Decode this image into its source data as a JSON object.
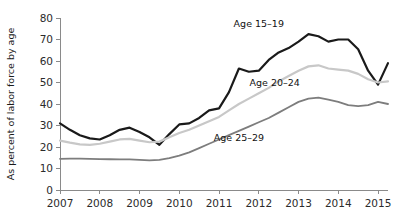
{
  "chart_data": {
    "type": "line",
    "title": "",
    "xlabel": "",
    "ylabel": "As percent of labor force by age",
    "xlim": [
      2007,
      2015.25
    ],
    "ylim": [
      0,
      80
    ],
    "grid": false,
    "legend_position": "inline-annotations",
    "x_ticks": [
      "2007",
      "2008",
      "2009",
      "2010",
      "2011",
      "2012",
      "2013",
      "2014",
      "2015"
    ],
    "x_tick_values": [
      2007,
      2008,
      2009,
      2010,
      2011,
      2012,
      2013,
      2014,
      2015
    ],
    "y_ticks": [
      "0",
      "10",
      "20",
      "30",
      "40",
      "50",
      "60",
      "70",
      "80"
    ],
    "y_tick_values": [
      0,
      10,
      20,
      30,
      40,
      50,
      60,
      70,
      80
    ],
    "x": [
      2007.0,
      2007.25,
      2007.5,
      2007.75,
      2008.0,
      2008.25,
      2008.5,
      2008.75,
      2009.0,
      2009.25,
      2009.5,
      2009.75,
      2010.0,
      2010.25,
      2010.5,
      2010.75,
      2011.0,
      2011.25,
      2011.5,
      2011.75,
      2012.0,
      2012.25,
      2012.5,
      2012.75,
      2013.0,
      2013.25,
      2013.5,
      2013.75,
      2014.0,
      2014.25,
      2014.5,
      2014.75,
      2015.0,
      2015.25
    ],
    "series": [
      {
        "name": "Age 15-19",
        "label": "Age 15–19",
        "color": "#1a1a1a",
        "width": 2.2,
        "values": [
          31.0,
          28.0,
          25.5,
          24.0,
          23.5,
          25.5,
          28.0,
          29.0,
          27.0,
          24.5,
          21.0,
          26.0,
          30.5,
          31.0,
          33.5,
          37.0,
          38.0,
          45.5,
          56.5,
          55.0,
          55.5,
          60.5,
          64.0,
          66.0,
          69.0,
          72.5,
          71.5,
          69.0,
          70.0,
          70.0,
          65.5,
          55.5,
          49.0,
          59.0
        ]
      },
      {
        "name": "Age 20-24",
        "label": "Age 20–24",
        "color": "#c8c8c8",
        "width": 2.2,
        "values": [
          23.0,
          22.0,
          21.2,
          21.0,
          21.5,
          22.5,
          23.5,
          23.8,
          23.0,
          22.2,
          22.5,
          24.5,
          26.5,
          28.0,
          30.0,
          32.0,
          34.0,
          37.0,
          40.0,
          42.5,
          45.0,
          47.5,
          50.5,
          53.0,
          55.5,
          57.5,
          58.0,
          56.5,
          56.0,
          55.5,
          54.0,
          51.5,
          50.0,
          50.5
        ]
      },
      {
        "name": "Age 25-29",
        "label": "Age 25–29",
        "color": "#7d7d7d",
        "width": 1.8,
        "values": [
          14.5,
          14.6,
          14.6,
          14.5,
          14.4,
          14.3,
          14.2,
          14.2,
          14.0,
          13.8,
          14.0,
          14.8,
          16.0,
          17.5,
          19.5,
          21.5,
          23.5,
          25.5,
          27.5,
          29.5,
          31.5,
          33.5,
          36.0,
          38.5,
          41.0,
          42.5,
          43.0,
          42.0,
          41.0,
          39.5,
          39.0,
          39.5,
          41.0,
          40.0
        ]
      }
    ],
    "annotations": [
      {
        "text": "Age 15–19",
        "x": 2012.0,
        "y": 76.0,
        "name": "series-label-age-15-19"
      },
      {
        "text": "Age 20–24",
        "x": 2012.4,
        "y": 48.5,
        "name": "series-label-age-20-24"
      },
      {
        "text": "Age 25–29",
        "x": 2011.5,
        "y": 23.0,
        "name": "series-label-age-25-29"
      }
    ]
  }
}
